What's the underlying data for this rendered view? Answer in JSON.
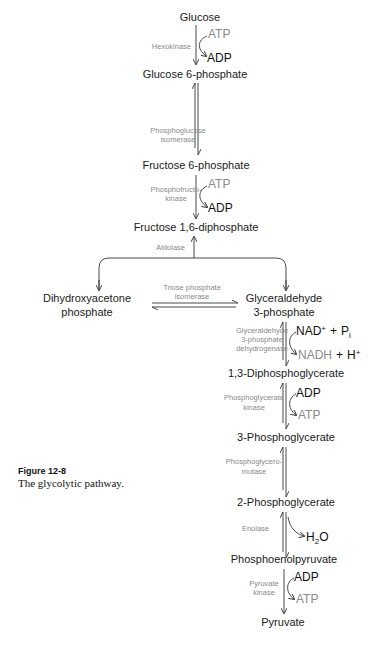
{
  "figure": {
    "label": "Figure 12-8",
    "caption": "The glycolytic pathway."
  },
  "compounds": {
    "glucose": "Glucose",
    "g6p": "Glucose 6-phosphate",
    "f6p": "Fructose 6-phosphate",
    "f16bp": "Fructose 1,6-diphosphate",
    "dhap_1": "Dihydroxyacetone",
    "dhap_2": "phosphate",
    "gap_1": "Glyceraldehyde",
    "gap_2": "3-phosphate",
    "bpg13": "1,3-Diphosphoglycerate",
    "pg3": "3-Phosphoglycerate",
    "pg2": "2-Phosphoglycerate",
    "pep": "Phosphoenolpyruvate",
    "pyruvate": "Pyruvate"
  },
  "enzymes": {
    "hexokinase": "Hexokinase",
    "pgi_1": "Phosphoglucose",
    "pgi_2": "isomerase",
    "pfk_1": "Phosphofructo-",
    "pfk_2": "kinase",
    "aldolase": "Aldolase",
    "tpi_1": "Triose phosphate",
    "tpi_2": "isomerase",
    "gapdh_1": "Glyceraldehyde",
    "gapdh_2": "3-phosphate",
    "gapdh_3": "dehydrogenase",
    "pgk_1": "Phosphoglycerate",
    "pgk_2": "kinase",
    "pgm_1": "Phosphoglycero-",
    "pgm_2": "mutase",
    "enolase": "Enolase",
    "pk_1": "Pyruvate",
    "pk_2": "kinase"
  },
  "cofactors": {
    "atp": "ATP",
    "adp": "ADP",
    "nad": "NAD",
    "nad_sup": "+",
    "plus": "+",
    "pi_p": "P",
    "pi_sub": "i",
    "nadh": "NADH",
    "h": "H",
    "h_sup": "+",
    "h2o_h": "H",
    "h2o_sub": "2",
    "h2o_o": "O"
  },
  "colors": {
    "compound_text": "#1a1a1a",
    "enzyme_text": "#8a8a8a",
    "arrow": "#333333"
  }
}
